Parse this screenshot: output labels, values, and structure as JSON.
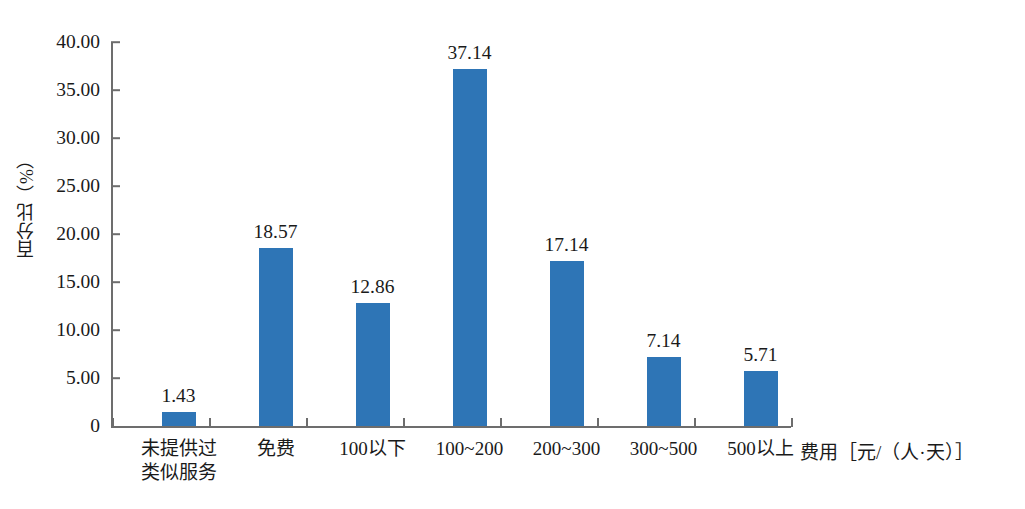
{
  "chart_data": {
    "type": "bar",
    "title": "",
    "subtitle": "",
    "xlabel": "费用［元/（人·天）］",
    "ylabel": "百分比（%）",
    "categories": [
      "未提供过\n类似服务",
      "免费",
      "100以下",
      "100~200",
      "200~300",
      "300~500",
      "500以上"
    ],
    "values": [
      1.43,
      18.57,
      12.86,
      37.14,
      17.14,
      7.14,
      5.71
    ],
    "value_labels": [
      "1.43",
      "18.57",
      "12.86",
      "37.14",
      "17.14",
      "7.14",
      "5.71"
    ],
    "ylim": [
      0,
      40
    ],
    "ytick_values": [
      0,
      5,
      10,
      15,
      20,
      25,
      30,
      35,
      40
    ],
    "ytick_labels": [
      "0",
      "5.00",
      "10.00",
      "15.00",
      "20.00",
      "25.00",
      "30.00",
      "35.00",
      "40.00"
    ],
    "grid": false,
    "legend": null,
    "legend_position": "none",
    "series_color": "#2e75b6",
    "axis_color": "#6d6d6d",
    "background": "#ffffff"
  }
}
